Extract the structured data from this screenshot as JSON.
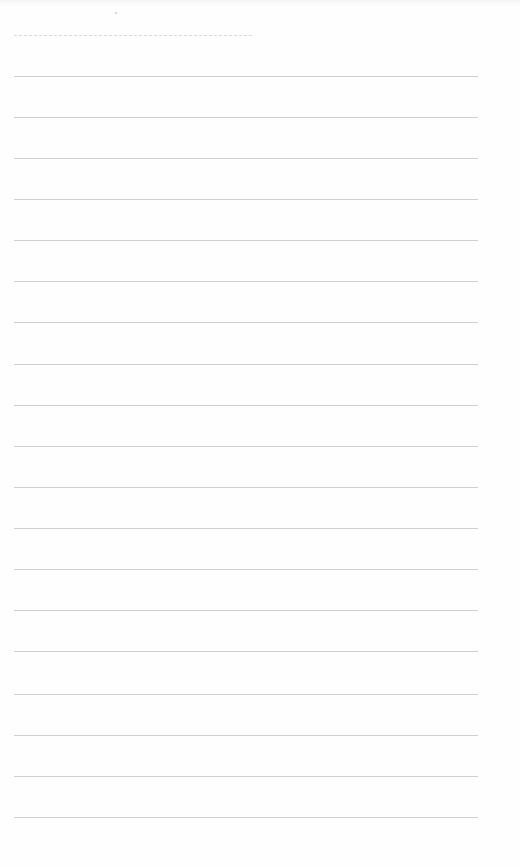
{
  "document": {
    "type": "lined-paper",
    "background_color": "#fefefe",
    "rule_color": "#cfcfcf",
    "header_line": {
      "style": "dashed",
      "x_start": 14,
      "x_end": 252,
      "y": 35,
      "color": "#d8d8d8"
    },
    "rules": {
      "count": 19,
      "x_start": 14,
      "x_end": 478,
      "y_positions": [
        76,
        117,
        158,
        199,
        240,
        281,
        322,
        364,
        405,
        446,
        487,
        528,
        569,
        610,
        651,
        694,
        735,
        776,
        817
      ]
    },
    "text": ""
  }
}
